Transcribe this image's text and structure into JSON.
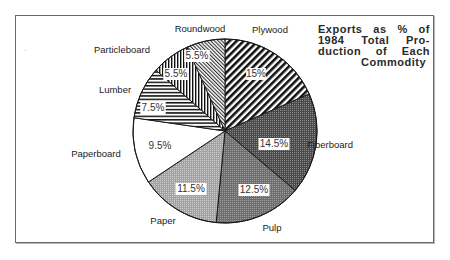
{
  "chart_data": {
    "type": "pie",
    "title_lines": [
      "Exports as % of",
      "1984 Total Pro-",
      "duction of Each",
      "Commodity"
    ],
    "start_angle": "12 o'clock",
    "direction": "clockwise",
    "note": "Slice sizes are drawn proportionally to the values (values sum to 81.5)",
    "categories": [
      "Plywood",
      "Fiberboard",
      "Pulp",
      "Paper",
      "Paperboard",
      "Lumber",
      "Particleboard",
      "Roundwood"
    ],
    "values": [
      15,
      14.5,
      12.5,
      11.5,
      9.5,
      7.5,
      5.5,
      5.5
    ],
    "value_labels": [
      "15%",
      "14.5%",
      "12.5%",
      "11.5%",
      "9.5%",
      "7.5%",
      "5.5%",
      "5.5%"
    ],
    "slices": [
      {
        "name": "Plywood",
        "value": 15,
        "label": "15%",
        "pattern": "bold-diagonal-forward"
      },
      {
        "name": "Fiberboard",
        "value": 14.5,
        "label": "14.5%",
        "pattern": "dark-dot-screen"
      },
      {
        "name": "Pulp",
        "value": 12.5,
        "label": "12.5%",
        "pattern": "medium-dark-gray-screen"
      },
      {
        "name": "Paper",
        "value": 11.5,
        "label": "11.5%",
        "pattern": "light-gray-screen"
      },
      {
        "name": "Paperboard",
        "value": 9.5,
        "label": "9.5%",
        "pattern": "white"
      },
      {
        "name": "Lumber",
        "value": 7.5,
        "label": "7.5%",
        "pattern": "horizontal-stripes"
      },
      {
        "name": "Particleboard",
        "value": 5.5,
        "label": "5.5%",
        "pattern": "vertical-stripes"
      },
      {
        "name": "Roundwood",
        "value": 5.5,
        "label": "5.5%",
        "pattern": "fine-diagonal-back"
      }
    ],
    "legend": "none (direct labels)",
    "grid": false
  },
  "layout": {
    "center": [
      225,
      131
    ],
    "radius": 92,
    "category_label_positions": [
      [
        270,
        33
      ],
      [
        330,
        148
      ],
      [
        272,
        231
      ],
      [
        163,
        224
      ],
      [
        96,
        157
      ],
      [
        115,
        93
      ],
      [
        122,
        53
      ],
      [
        200,
        32
      ]
    ],
    "value_label_positions": [
      [
        256,
        77
      ],
      [
        274,
        147
      ],
      [
        254,
        193
      ],
      [
        191,
        192
      ],
      [
        160,
        149
      ],
      [
        153,
        111
      ],
      [
        176,
        77
      ],
      [
        197,
        59
      ]
    ],
    "value_label_boxed": [
      true,
      true,
      true,
      true,
      false,
      true,
      true,
      true
    ]
  }
}
